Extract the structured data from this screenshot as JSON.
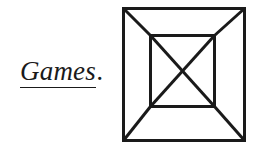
{
  "page": {
    "width": 265,
    "height": 150,
    "background_color": "#ffffff",
    "ink_color": "#1a1a1a"
  },
  "caption": {
    "name": "games-caption",
    "word": "Games",
    "period": ".",
    "full_text": "Games.",
    "style": "italic-serif-underlined",
    "underline": true,
    "underline_covers": "Games"
  },
  "figure": {
    "name": "nested-square-diagram",
    "stroke_color": "#1a1a1a",
    "stroke_width": 3,
    "fill": "none",
    "outer_square": {
      "x": 4,
      "y": 4,
      "width": 122,
      "height": 133
    },
    "inner_square": {
      "x": 32,
      "y": 32,
      "width": 64,
      "height": 71
    },
    "corner_connectors": [
      {
        "from": "outer-top-left",
        "to": "inner-top-left"
      },
      {
        "from": "outer-top-right",
        "to": "inner-top-right"
      },
      {
        "from": "outer-bottom-right",
        "to": "inner-bottom-right"
      },
      {
        "from": "outer-bottom-left",
        "to": "inner-bottom-left"
      }
    ],
    "inner_diagonals": [
      {
        "from": "inner-top-left",
        "to": "inner-bottom-right"
      },
      {
        "from": "inner-top-right",
        "to": "inner-bottom-left"
      }
    ]
  }
}
